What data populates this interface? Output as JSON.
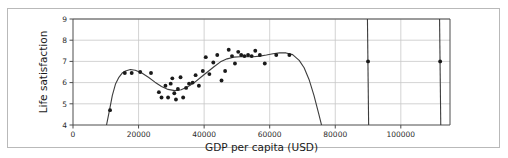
{
  "figure": {
    "border_color": "#b9b9b9",
    "background": "#ffffff"
  },
  "chart_data": {
    "type": "scatter",
    "title": "",
    "xlabel": "GDP per capita (USD)",
    "ylabel": "Life satisfaction",
    "xlim": [
      0,
      115000
    ],
    "ylim": [
      4,
      9
    ],
    "xticks": [
      0,
      20000,
      40000,
      60000,
      80000,
      100000
    ],
    "xticklabels": [
      "0",
      "20000",
      "40000",
      "60000",
      "80000",
      "100000"
    ],
    "yticks": [
      4,
      5,
      6,
      7,
      8,
      9
    ],
    "yticklabels": [
      "4",
      "5",
      "6",
      "7",
      "8",
      "9"
    ],
    "grid": true,
    "grid_color": "#c8c8c8",
    "axis_color": "#4d4d4d",
    "legend": null,
    "marker_color": "#1a1a1a",
    "marker_size": 3,
    "line_color": "#3d3d3d",
    "points": [
      {
        "x": 11300,
        "y": 4.7
      },
      {
        "x": 15800,
        "y": 6.45
      },
      {
        "x": 17900,
        "y": 6.45
      },
      {
        "x": 20500,
        "y": 6.5
      },
      {
        "x": 23800,
        "y": 6.45
      },
      {
        "x": 26200,
        "y": 5.55
      },
      {
        "x": 27000,
        "y": 5.3
      },
      {
        "x": 28200,
        "y": 5.85
      },
      {
        "x": 29000,
        "y": 5.3
      },
      {
        "x": 29800,
        "y": 5.95
      },
      {
        "x": 30300,
        "y": 6.2
      },
      {
        "x": 30900,
        "y": 5.5
      },
      {
        "x": 31400,
        "y": 5.2
      },
      {
        "x": 32000,
        "y": 5.7
      },
      {
        "x": 32800,
        "y": 6.25
      },
      {
        "x": 33600,
        "y": 5.3
      },
      {
        "x": 34500,
        "y": 5.75
      },
      {
        "x": 35400,
        "y": 5.95
      },
      {
        "x": 36500,
        "y": 6.0
      },
      {
        "x": 37400,
        "y": 6.35
      },
      {
        "x": 38400,
        "y": 5.85
      },
      {
        "x": 39600,
        "y": 6.55
      },
      {
        "x": 40500,
        "y": 7.2
      },
      {
        "x": 41600,
        "y": 6.4
      },
      {
        "x": 42800,
        "y": 6.95
      },
      {
        "x": 44000,
        "y": 7.3
      },
      {
        "x": 45300,
        "y": 6.1
      },
      {
        "x": 46400,
        "y": 6.55
      },
      {
        "x": 47500,
        "y": 7.55
      },
      {
        "x": 48500,
        "y": 7.25
      },
      {
        "x": 49400,
        "y": 6.9
      },
      {
        "x": 50400,
        "y": 7.45
      },
      {
        "x": 51300,
        "y": 7.3
      },
      {
        "x": 52300,
        "y": 7.25
      },
      {
        "x": 53400,
        "y": 7.3
      },
      {
        "x": 54500,
        "y": 7.25
      },
      {
        "x": 55600,
        "y": 7.5
      },
      {
        "x": 57000,
        "y": 7.3
      },
      {
        "x": 58500,
        "y": 6.9
      },
      {
        "x": 62000,
        "y": 7.3
      },
      {
        "x": 66000,
        "y": 7.3
      },
      {
        "x": 90000,
        "y": 7.0
      },
      {
        "x": 112000,
        "y": 7.0
      }
    ],
    "fit_curve": {
      "description": "polynomial regression curve through scatter, peaking near 18000 and 66000, dipping near 31000, plunging below axis after 70000 and returning as near-vertical lines at 90000 and 112000",
      "points": [
        {
          "x": 10100,
          "y": 3.9
        },
        {
          "x": 11000,
          "y": 4.6
        },
        {
          "x": 12000,
          "y": 5.4
        },
        {
          "x": 13000,
          "y": 5.95
        },
        {
          "x": 14000,
          "y": 6.25
        },
        {
          "x": 15000,
          "y": 6.45
        },
        {
          "x": 16000,
          "y": 6.55
        },
        {
          "x": 17500,
          "y": 6.62
        },
        {
          "x": 19000,
          "y": 6.58
        },
        {
          "x": 21000,
          "y": 6.45
        },
        {
          "x": 23000,
          "y": 6.25
        },
        {
          "x": 25000,
          "y": 6.02
        },
        {
          "x": 27000,
          "y": 5.82
        },
        {
          "x": 29000,
          "y": 5.68
        },
        {
          "x": 31000,
          "y": 5.62
        },
        {
          "x": 33000,
          "y": 5.66
        },
        {
          "x": 35000,
          "y": 5.8
        },
        {
          "x": 37000,
          "y": 6.0
        },
        {
          "x": 39000,
          "y": 6.25
        },
        {
          "x": 41000,
          "y": 6.5
        },
        {
          "x": 43000,
          "y": 6.75
        },
        {
          "x": 45000,
          "y": 6.98
        },
        {
          "x": 47000,
          "y": 7.12
        },
        {
          "x": 49000,
          "y": 7.2
        },
        {
          "x": 51000,
          "y": 7.22
        },
        {
          "x": 53000,
          "y": 7.22
        },
        {
          "x": 55000,
          "y": 7.22
        },
        {
          "x": 57000,
          "y": 7.25
        },
        {
          "x": 59000,
          "y": 7.3
        },
        {
          "x": 61000,
          "y": 7.36
        },
        {
          "x": 63000,
          "y": 7.4
        },
        {
          "x": 65000,
          "y": 7.4
        },
        {
          "x": 67000,
          "y": 7.32
        },
        {
          "x": 69000,
          "y": 7.05
        },
        {
          "x": 70500,
          "y": 6.7
        },
        {
          "x": 72000,
          "y": 6.15
        },
        {
          "x": 73500,
          "y": 5.4
        },
        {
          "x": 75000,
          "y": 4.5
        },
        {
          "x": 76300,
          "y": 3.7
        }
      ],
      "vertical_segments": [
        {
          "x": 90000,
          "y_top": 9.0,
          "y_bottom": 4.0
        },
        {
          "x": 112000,
          "y_top": 9.0,
          "y_bottom": 4.0
        }
      ]
    }
  }
}
